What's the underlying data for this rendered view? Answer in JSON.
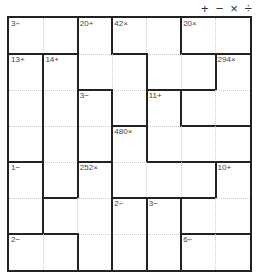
{
  "puzzle": {
    "type": "KenKen",
    "size": 7,
    "operators": [
      {
        "name": "plus-operator",
        "symbol": "+"
      },
      {
        "name": "minus-operator",
        "symbol": "−"
      },
      {
        "name": "times-operator",
        "symbol": "×"
      },
      {
        "name": "divide-operator",
        "symbol": "÷"
      }
    ],
    "cages": [
      {
        "label": "3÷",
        "cells": [
          [
            0,
            0
          ],
          [
            0,
            1
          ]
        ]
      },
      {
        "label": "20+",
        "cells": [
          [
            0,
            2
          ],
          [
            1,
            2
          ],
          [
            1,
            3
          ],
          [
            2,
            3
          ]
        ]
      },
      {
        "label": "42×",
        "cells": [
          [
            0,
            3
          ],
          [
            0,
            4
          ],
          [
            1,
            4
          ],
          [
            1,
            5
          ]
        ]
      },
      {
        "label": "20×",
        "cells": [
          [
            0,
            5
          ],
          [
            0,
            6
          ]
        ]
      },
      {
        "label": "13+",
        "cells": [
          [
            1,
            0
          ],
          [
            2,
            0
          ],
          [
            3,
            0
          ]
        ]
      },
      {
        "label": "14+",
        "cells": [
          [
            1,
            1
          ],
          [
            2,
            1
          ],
          [
            3,
            1
          ],
          [
            4,
            1
          ]
        ]
      },
      {
        "label": "294×",
        "cells": [
          [
            1,
            6
          ],
          [
            2,
            5
          ],
          [
            2,
            6
          ]
        ]
      },
      {
        "label": "3−",
        "cells": [
          [
            2,
            2
          ],
          [
            3,
            2
          ]
        ]
      },
      {
        "label": "11+",
        "cells": [
          [
            2,
            4
          ],
          [
            3,
            4
          ],
          [
            3,
            5
          ],
          [
            3,
            6
          ]
        ]
      },
      {
        "label": "480×",
        "cells": [
          [
            3,
            3
          ],
          [
            4,
            3
          ],
          [
            4,
            4
          ],
          [
            4,
            5
          ]
        ]
      },
      {
        "label": "1−",
        "cells": [
          [
            4,
            0
          ],
          [
            5,
            0
          ]
        ]
      },
      {
        "label": "252×",
        "cells": [
          [
            4,
            2
          ],
          [
            5,
            1
          ],
          [
            5,
            2
          ],
          [
            6,
            2
          ]
        ]
      },
      {
        "label": "10+",
        "cells": [
          [
            4,
            6
          ],
          [
            5,
            5
          ],
          [
            5,
            6
          ]
        ]
      },
      {
        "label": "2÷",
        "cells": [
          [
            5,
            3
          ],
          [
            6,
            3
          ]
        ]
      },
      {
        "label": "3−",
        "cells": [
          [
            5,
            4
          ],
          [
            6,
            4
          ]
        ]
      },
      {
        "label": "2−",
        "cells": [
          [
            6,
            0
          ],
          [
            6,
            1
          ]
        ]
      },
      {
        "label": "6÷",
        "cells": [
          [
            6,
            5
          ],
          [
            6,
            6
          ]
        ]
      }
    ]
  },
  "colors": {
    "thick_border": "#222222",
    "thin_border": "#cccccc",
    "label": "#444444",
    "background": "#ffffff"
  }
}
